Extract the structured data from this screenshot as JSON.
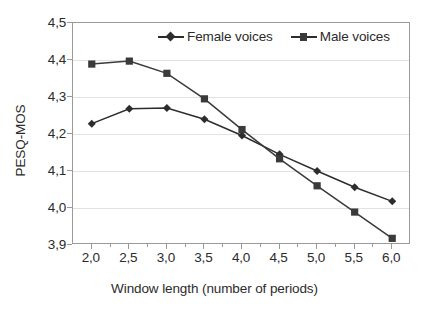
{
  "chart_data": {
    "type": "line",
    "title": "",
    "xlabel": "Window length (number of periods)",
    "ylabel": "PESQ-MOS",
    "xlim": [
      1.75,
      6.25
    ],
    "ylim": [
      3.9,
      4.5
    ],
    "grid": true,
    "legend_position": "top-center-inside",
    "x": [
      2.0,
      2.5,
      3.0,
      3.5,
      4.0,
      4.5,
      5.0,
      5.5,
      6.0
    ],
    "xtick_labels": [
      "2,0",
      "2,5",
      "3,0",
      "3,5",
      "4,0",
      "4,5",
      "5,0",
      "5,5",
      "6,0"
    ],
    "ytick_labels": [
      "4,5",
      "4,4",
      "4,3",
      "4,2",
      "4,1",
      "4,0",
      "3,9"
    ],
    "ytick_values": [
      4.5,
      4.4,
      4.3,
      4.2,
      4.1,
      4.0,
      3.9
    ],
    "series": [
      {
        "name": "Female voices",
        "marker": "diamond",
        "color": "#2d2d2d",
        "values": [
          4.228,
          4.268,
          4.27,
          4.24,
          4.196,
          4.145,
          4.1,
          4.056,
          4.018
        ]
      },
      {
        "name": "Male voices",
        "marker": "square",
        "color": "#3a3a3a",
        "values": [
          4.389,
          4.397,
          4.364,
          4.295,
          4.212,
          4.133,
          4.06,
          3.989,
          3.918
        ]
      }
    ]
  },
  "legend": {
    "items": [
      {
        "label": "Female voices",
        "marker": "diamond-marker"
      },
      {
        "label": "Male voices",
        "marker": "square-marker"
      }
    ]
  },
  "colors": {
    "series_female": "#2d2d2d",
    "series_male": "#3a3a3a",
    "gridline": "#e2e2e2",
    "axis": "#9a9a9a",
    "text": "#2b2b2b",
    "background": "#ffffff"
  }
}
